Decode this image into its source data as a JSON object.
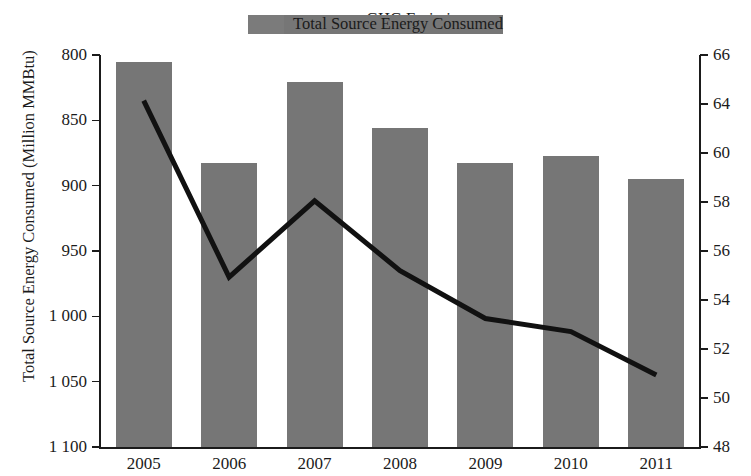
{
  "legend": {
    "items": [
      {
        "label": "Total Source Energy Consumed",
        "marker": "bar-swatch-icon",
        "color": "#767676"
      },
      {
        "label": "GHG Emissions",
        "marker": "line-swatch-icon",
        "color": "#111111"
      }
    ]
  },
  "axes": {
    "y_left_title": "Total Source Energy Consumed (Million MMBtu)",
    "y_left_ticks": [
      "1 100",
      "1 050",
      "1 000",
      "950",
      "900",
      "850",
      "800"
    ],
    "y_right_ticks": [
      "66",
      "64",
      "60",
      "58",
      "56",
      "54",
      "52",
      "50",
      "48"
    ],
    "x_ticks": [
      "2005",
      "2006",
      "2007",
      "2008",
      "2009",
      "2010",
      "2011"
    ]
  },
  "chart_data": {
    "type": "bar",
    "title": "",
    "xlabel": "",
    "ylabel": "Total Source Energy Consumed (Million MMBtu)",
    "y2label": "",
    "categories": [
      "2005",
      "2006",
      "2007",
      "2008",
      "2009",
      "2010",
      "2011"
    ],
    "grid": false,
    "legend_position": "top-center",
    "ylim": [
      800,
      1100
    ],
    "y2lim": [
      48,
      66
    ],
    "yticks": [
      800,
      850,
      900,
      950,
      1000,
      1050,
      1100
    ],
    "y2ticks": [
      48,
      50,
      52,
      54,
      56,
      58,
      60,
      64,
      66
    ],
    "series": [
      {
        "name": "Total Source Energy Consumed",
        "type": "bar",
        "axis": "left",
        "unit": "Million MMBtu",
        "color": "#767676",
        "values": [
          1095,
          1017,
          1079,
          1044,
          1017,
          1023,
          1005
        ]
      },
      {
        "name": "GHG Emissions",
        "type": "line",
        "axis": "right",
        "color": "#111111",
        "values": [
          63.9,
          55.8,
          59.3,
          56.1,
          53.9,
          53.3,
          51.3
        ]
      }
    ]
  }
}
